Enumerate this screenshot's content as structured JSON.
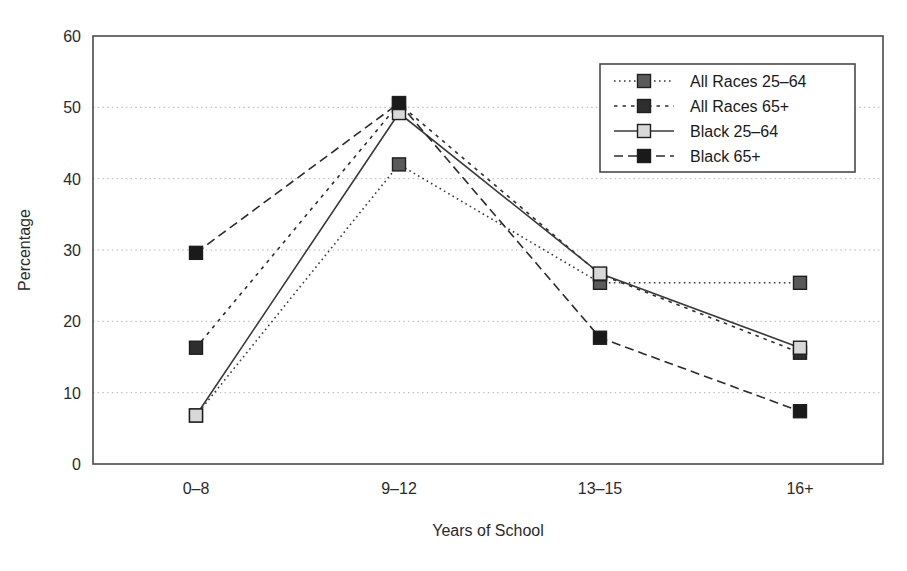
{
  "chart_data": {
    "type": "line",
    "title": "",
    "xlabel": "Years of School",
    "ylabel": "Percentage",
    "categories": [
      "0–8",
      "9–12",
      "13–15",
      "16+"
    ],
    "ylim": [
      0,
      60
    ],
    "yticks": [
      0,
      10,
      20,
      30,
      40,
      50,
      60
    ],
    "ytick_labels": [
      "0",
      "10",
      "20",
      "30",
      "40",
      "50",
      "60"
    ],
    "grid": "horizontal-dotted",
    "legend_position": "top-right-inside",
    "series": [
      {
        "name": "All Races 25–64",
        "values": [
          6.8,
          42.0,
          25.4,
          25.4
        ],
        "line_style": "dotted",
        "marker": "square",
        "marker_fill": "#5a5a5a",
        "color": "#3a3a3a"
      },
      {
        "name": "All Races 65+",
        "values": [
          16.3,
          50.5,
          26.6,
          15.6
        ],
        "line_style": "dashed-short",
        "marker": "square",
        "marker_fill": "#2e2e2e",
        "color": "#2e2e2e"
      },
      {
        "name": "Black 25–64",
        "values": [
          6.8,
          49.2,
          26.7,
          16.3
        ],
        "line_style": "solid",
        "marker": "square",
        "marker_fill": "#d8d8d8",
        "color": "#3a3a3a"
      },
      {
        "name": "Black 65+",
        "values": [
          29.6,
          50.6,
          17.7,
          7.4
        ],
        "line_style": "dashed-long",
        "marker": "square",
        "marker_fill": "#1a1a1a",
        "color": "#2b2b2b"
      }
    ]
  },
  "legend": {
    "entries": [
      {
        "label": "All Races 25–64"
      },
      {
        "label": "All Races 65+"
      },
      {
        "label": "Black 25–64"
      },
      {
        "label": "Black 65+"
      }
    ]
  },
  "colors": {
    "frame": "#4a4a4a",
    "grid": "#b4b4b4",
    "text": "#2b2b2b",
    "background": "#ffffff"
  }
}
